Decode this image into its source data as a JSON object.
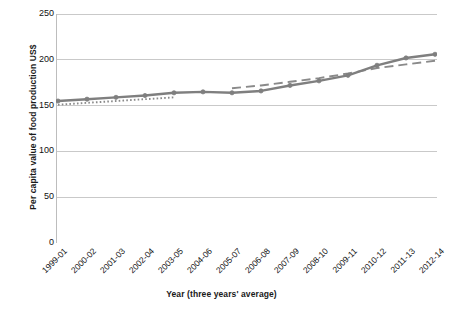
{
  "chart_data": {
    "type": "line",
    "title": "",
    "xlabel": "Year (three years' average)",
    "ylabel": "Per capita value of food production US$",
    "categories": [
      "1999-01",
      "2000-02",
      "2001-03",
      "2002-04",
      "2003-05",
      "2004-06",
      "2005-07",
      "2006-08",
      "2007-09",
      "2008-10",
      "2009-11",
      "2010-12",
      "2011-13",
      "2012-14"
    ],
    "ylim": [
      0,
      250
    ],
    "yticks": [
      0,
      50,
      100,
      150,
      200,
      250
    ],
    "ytick_labels": [
      "0",
      "50",
      "100",
      "150",
      "200",
      "250"
    ],
    "grid": "horizontal",
    "legend": "none",
    "series": [
      {
        "name": "per-capita-value-of-food-production",
        "style": "solid-with-round-markers",
        "color": "#7f7f7f",
        "marker": "circle",
        "values": [
          155,
          157,
          159,
          161,
          164,
          165,
          164,
          166,
          172,
          177,
          183,
          194,
          202,
          206
        ]
      },
      {
        "name": "dotted-trend-early",
        "style": "dotted",
        "color": "#8a8a8a",
        "marker": "none",
        "x_range": [
          "1999-01",
          "2003-05"
        ],
        "values": [
          151,
          153,
          155,
          157,
          159,
          null,
          null,
          null,
          null,
          null,
          null,
          null,
          null,
          null
        ]
      },
      {
        "name": "dashed-trend-late",
        "style": "dashed",
        "color": "#8a8a8a",
        "marker": "none",
        "x_range": [
          "2005-07",
          "2012-14"
        ],
        "values": [
          null,
          null,
          null,
          null,
          null,
          null,
          169,
          172,
          176,
          180,
          185,
          191,
          195,
          199
        ]
      }
    ]
  },
  "colors": {
    "series_line": "#7f7f7f",
    "trend_line": "#8a8a8a",
    "gridline": "#c9c9c9",
    "axis": "#bdbdbd",
    "text": "#111111"
  }
}
